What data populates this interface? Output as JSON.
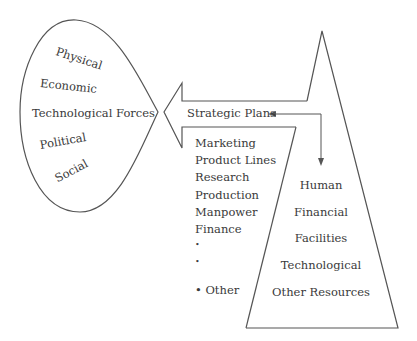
{
  "environment": {
    "title": "",
    "items": [
      {
        "label": "Physical",
        "x": 56,
        "y": 50,
        "rot": 18
      },
      {
        "label": "Economic",
        "x": 40,
        "y": 76,
        "rot": 6
      },
      {
        "label": "Technological Forces",
        "x": 32,
        "y": 108,
        "rot": 0
      },
      {
        "label": "Political",
        "x": 40,
        "y": 136,
        "rot": -10
      },
      {
        "label": "Social",
        "x": 56,
        "y": 164,
        "rot": -28
      }
    ]
  },
  "strategy": {
    "label": "Strategic Plans",
    "functions": [
      "Marketing",
      "Product Lines",
      "Research",
      "Production",
      "Manpower",
      "Finance",
      "•",
      "•",
      "• Other"
    ]
  },
  "resources": {
    "items": [
      "Human",
      "Financial",
      "Facilities",
      "Technological",
      "Other Resources"
    ]
  },
  "colors": {
    "stroke": "#555555",
    "text": "#3a3a3a",
    "background": "#ffffff"
  }
}
